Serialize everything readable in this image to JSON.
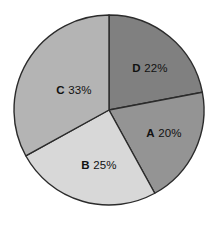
{
  "chart_data": {
    "type": "pie",
    "title": "",
    "categories": [
      "A",
      "B",
      "C",
      "D"
    ],
    "values": [
      20,
      25,
      33,
      22
    ],
    "unit": "%",
    "legend": "none",
    "labels_inside": true,
    "start_angle_deg": 0,
    "direction": "clockwise",
    "slices": [
      {
        "key": "D",
        "value": 22,
        "label": "D 22%",
        "key_text": "D",
        "pct_text": "22%",
        "color": "#808080",
        "start_deg": 0,
        "end_deg": 79.2,
        "label_x": 150,
        "label_y": 68
      },
      {
        "key": "A",
        "value": 20,
        "label": "A 20%",
        "key_text": "A",
        "pct_text": "20%",
        "color": "#949494",
        "start_deg": 79.2,
        "end_deg": 151.2,
        "label_x": 164,
        "label_y": 133
      },
      {
        "key": "B",
        "value": 25,
        "label": "B 25%",
        "key_text": "B",
        "pct_text": "25%",
        "color": "#d8d8d8",
        "start_deg": 151.2,
        "end_deg": 241.2,
        "label_x": 99,
        "label_y": 165
      },
      {
        "key": "C",
        "value": 33,
        "label": "C 33%",
        "key_text": "C",
        "pct_text": "33%",
        "color": "#b4b4b4",
        "start_deg": 241.2,
        "end_deg": 360,
        "label_x": 74,
        "label_y": 90
      }
    ],
    "geometry": {
      "center_x": 109,
      "center_y": 110,
      "radius": 95
    },
    "colors": {
      "background": "#ffffff",
      "outline": "#2b2b2b",
      "text": "#111111"
    }
  }
}
